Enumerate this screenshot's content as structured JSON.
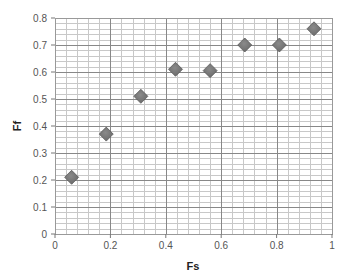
{
  "chart_data": {
    "type": "scatter",
    "title": "",
    "xlabel": "Fs",
    "ylabel": "Ff",
    "xlim": [
      0,
      1
    ],
    "ylim": [
      0,
      0.8
    ],
    "x_ticks": [
      0,
      0.2,
      0.4,
      0.6,
      0.8,
      1
    ],
    "x_tick_labels": [
      "0",
      "0.2",
      "0.4",
      "0.6",
      "0.8",
      "1"
    ],
    "y_ticks": [
      0,
      0.1,
      0.2,
      0.3,
      0.4,
      0.5,
      0.6,
      0.7,
      0.8
    ],
    "y_tick_labels": [
      "0",
      "0.1",
      "0.2",
      "0.3",
      "0.4",
      "0.5",
      "0.6",
      "0.7",
      "0.8"
    ],
    "grid": true,
    "minor_grid": {
      "x_step": 0.04,
      "y_step": 0.02
    },
    "legend": null,
    "marker": "diamond",
    "colors": {
      "marker": "#6b6b6b",
      "major_grid": "#888888",
      "minor_grid": "#c8c8c8",
      "axis": "#777777"
    },
    "series": [
      {
        "name": "Ff vs Fs",
        "x": [
          0.06,
          0.185,
          0.31,
          0.435,
          0.56,
          0.685,
          0.81,
          0.935
        ],
        "y": [
          0.21,
          0.37,
          0.51,
          0.61,
          0.605,
          0.7,
          0.7,
          0.76
        ]
      }
    ]
  }
}
